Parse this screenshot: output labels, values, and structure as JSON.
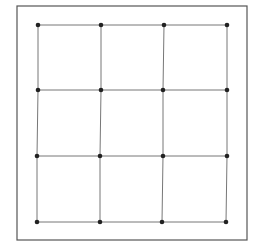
{
  "diagram": {
    "type": "grid-lattice",
    "rows": 4,
    "cols": 4,
    "cells": "3x3",
    "frame": {
      "x1": 17,
      "y1": 6,
      "x2": 247,
      "y2": 240
    },
    "nodes": [
      [
        {
          "x": 38,
          "y": 25
        },
        {
          "x": 101,
          "y": 25
        },
        {
          "x": 164,
          "y": 25
        },
        {
          "x": 227,
          "y": 25
        }
      ],
      [
        {
          "x": 38,
          "y": 90
        },
        {
          "x": 101,
          "y": 90
        },
        {
          "x": 163,
          "y": 90
        },
        {
          "x": 227,
          "y": 90
        }
      ],
      [
        {
          "x": 37,
          "y": 156
        },
        {
          "x": 100,
          "y": 156
        },
        {
          "x": 163,
          "y": 156
        },
        {
          "x": 227,
          "y": 156
        }
      ],
      [
        {
          "x": 37,
          "y": 222
        },
        {
          "x": 100,
          "y": 222
        },
        {
          "x": 162,
          "y": 222
        },
        {
          "x": 226,
          "y": 222
        }
      ]
    ],
    "colors": {
      "background": "#ffffff",
      "frame": "#555555",
      "line": "#777777",
      "node": "#222222"
    },
    "node_radius": 2.3,
    "line_width": 1,
    "frame_width": 1.2
  }
}
